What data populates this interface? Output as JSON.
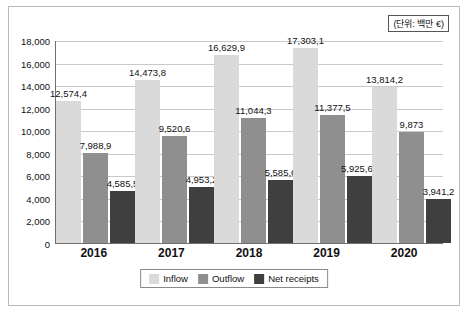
{
  "unit_note": "(단위: 백만 €)",
  "chart_data": {
    "type": "bar",
    "title": "",
    "subtitle": "",
    "xlabel": "",
    "ylabel": "",
    "unit_label": "(단위: 백만 €)",
    "grid": true,
    "legend_position": "bottom",
    "ylim": [
      0,
      18000
    ],
    "yticks": [
      0,
      2000,
      4000,
      6000,
      8000,
      10000,
      12000,
      14000,
      16000,
      18000
    ],
    "ytick_labels": [
      "0",
      "2,000",
      "4,000",
      "6,000",
      "8,000",
      "10,000",
      "12,000",
      "14,000",
      "16,000",
      "18,000"
    ],
    "categories": [
      "2016",
      "2017",
      "2018",
      "2019",
      "2020"
    ],
    "series": [
      {
        "name": "Inflow",
        "color": "#dadada",
        "values": [
          12574.4,
          14473.8,
          16629.9,
          17303.1,
          13814.2
        ],
        "labels": [
          "12,574,4",
          "14,473,8",
          "16,629,9",
          "17,303,1",
          "13,814,2"
        ]
      },
      {
        "name": "Outflow",
        "color": "#8f8f8f",
        "values": [
          7988.9,
          9520.6,
          11044.3,
          11377.5,
          9873
        ],
        "labels": [
          "7,988,9",
          "9,520,6",
          "11,044,3",
          "11,377,5",
          "9,873"
        ]
      },
      {
        "name": "Net receipts",
        "color": "#3f3f3f",
        "values": [
          4585.5,
          4953.2,
          5585.6,
          5925.65,
          3941.2
        ],
        "labels": [
          "4,585,5",
          "4,953,2",
          "5,585,6",
          "5,925,65",
          "3,941,2"
        ]
      }
    ]
  }
}
